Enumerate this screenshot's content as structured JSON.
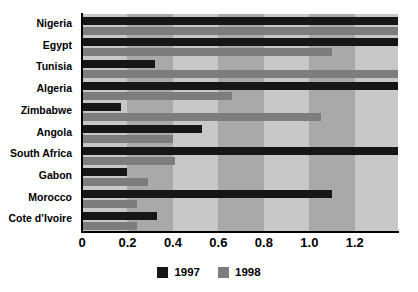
{
  "chart_data": {
    "type": "bar",
    "orientation": "horizontal",
    "title": "",
    "xlabel": "",
    "ylabel": "",
    "xlim": [
      0,
      1.39
    ],
    "grid": false,
    "legend_position": "bottom-center",
    "categories": [
      "Nigeria",
      "Egypt",
      "Tunisia",
      "Algeria",
      "Zimbabwe",
      "Angola",
      "South Africa",
      "Gabon",
      "Morocco",
      "Cote d’Ivoire"
    ],
    "tick_labels": [
      "0",
      "0.2",
      "0.4",
      "0.6",
      "0.8",
      "1.0",
      "1.2"
    ],
    "tick_values": [
      0,
      0.2,
      0.4,
      0.6,
      0.8,
      1.0,
      1.2
    ],
    "series": [
      {
        "name": "1997",
        "color": "#161616",
        "values": [
          1.39,
          1.39,
          0.32,
          1.39,
          0.17,
          0.53,
          1.39,
          0.2,
          1.1,
          0.33
        ]
      },
      {
        "name": "1998",
        "color": "#7d7d7d",
        "values": [
          1.39,
          1.1,
          1.39,
          0.66,
          1.05,
          0.4,
          0.41,
          0.29,
          0.24,
          0.24
        ]
      }
    ]
  },
  "legend": {
    "entries": [
      {
        "label": "1997",
        "color": "#161616"
      },
      {
        "label": "1998",
        "color": "#7d7d7d"
      }
    ]
  },
  "colors": {
    "bar_1997": "#161616",
    "bar_1998": "#7d7d7d",
    "band_light": "#c8c8c8",
    "band_dark": "#a9a9a9",
    "axis": "#000000",
    "background": "#ffffff"
  }
}
